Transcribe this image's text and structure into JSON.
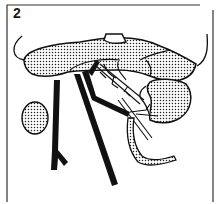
{
  "figure": {
    "panel_label": "2",
    "style": {
      "ink": "#111111",
      "background": "#ffffff",
      "stipple": "#222222"
    },
    "elements": [
      {
        "name": "frame-border",
        "shape": "open rectangle (top-left, left, right, bottom edges)"
      },
      {
        "name": "large-stippled-organ-upper",
        "shape": "broad stippled lobed mass across top"
      },
      {
        "name": "rectangular-notch",
        "shape": "small outlined window on upper organ"
      },
      {
        "name": "small-stippled-organ-left",
        "shape": "oval stippled organ, left"
      },
      {
        "name": "stippled-organ-right",
        "shape": "stippled pouch-shaped organ, right"
      },
      {
        "name": "dark-vessel-left",
        "shape": "thick black branching vessel"
      },
      {
        "name": "dark-vessel-center",
        "shape": "thick black diagonal vessel"
      },
      {
        "name": "fine-branching-vessels",
        "shape": "thin vessels with small branches"
      },
      {
        "name": "stippled-duct",
        "shape": "curved stippled tube, lower right"
      },
      {
        "name": "hook-line-left",
        "shape": "curved retractor line, upper left"
      },
      {
        "name": "hook-line-right",
        "shape": "curved retractor line, upper right"
      }
    ]
  }
}
